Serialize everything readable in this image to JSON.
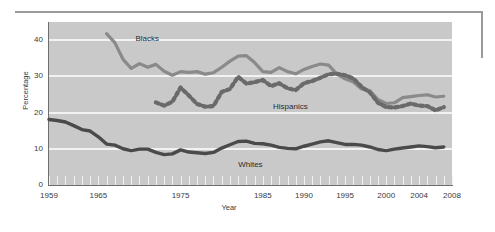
{
  "figure": {
    "y_axis_title": "Percentage",
    "x_axis_title": "Year"
  },
  "annotations": {
    "blacks": "Blacks",
    "hispanics": "Hispanics",
    "whites": "Whites"
  },
  "colors": {
    "plot_background": "#c9c9c9",
    "gridline": "#f2f2f2",
    "blacks_series": "#8a8a8a",
    "hispanics_series": "#6a6a6a",
    "whites_series": "#4a4a4a",
    "axis": "#6e6e6e",
    "text": "#3a3a3a",
    "rule": "#9a9a9a"
  },
  "chart_data": {
    "type": "line",
    "title": "",
    "xlabel": "Year",
    "ylabel": "Percentage",
    "xlim": [
      1959,
      2008
    ],
    "ylim": [
      0,
      45
    ],
    "yticks": [
      0,
      10,
      20,
      30,
      40
    ],
    "xticks": [
      1959,
      1965,
      1975,
      1985,
      1990,
      1995,
      2000,
      2004,
      2008
    ],
    "grid": "horizontal",
    "legend": "inline-annotations",
    "series": [
      {
        "name": "Blacks",
        "style": "solid",
        "color": "#8a8a8a",
        "x": [
          1966,
          1967,
          1968,
          1969,
          1970,
          1971,
          1972,
          1973,
          1974,
          1975,
          1976,
          1977,
          1978,
          1979,
          1980,
          1981,
          1982,
          1983,
          1984,
          1985,
          1986,
          1987,
          1988,
          1989,
          1990,
          1991,
          1992,
          1993,
          1994,
          1995,
          1996,
          1997,
          1998,
          1999,
          2000,
          2001,
          2002,
          2003,
          2004,
          2005,
          2006,
          2007
        ],
        "values": [
          41.8,
          39.3,
          34.7,
          32.2,
          33.5,
          32.5,
          33.3,
          31.4,
          30.3,
          31.3,
          31.1,
          31.3,
          30.6,
          31.0,
          32.5,
          34.2,
          35.6,
          35.7,
          33.8,
          31.3,
          31.1,
          32.4,
          31.3,
          30.7,
          31.9,
          32.7,
          33.4,
          33.1,
          30.6,
          29.3,
          28.4,
          26.5,
          26.1,
          23.6,
          22.5,
          22.7,
          24.1,
          24.4,
          24.7,
          24.9,
          24.3,
          24.5
        ]
      },
      {
        "name": "Hispanics",
        "style": "dashed",
        "color": "#6a6a6a",
        "x": [
          1972,
          1973,
          1974,
          1975,
          1976,
          1977,
          1978,
          1979,
          1980,
          1981,
          1982,
          1983,
          1984,
          1985,
          1986,
          1987,
          1988,
          1989,
          1990,
          1991,
          1992,
          1993,
          1994,
          1995,
          1996,
          1997,
          1998,
          1999,
          2000,
          2001,
          2002,
          2003,
          2004,
          2005,
          2006,
          2007
        ],
        "values": [
          22.8,
          21.9,
          23.0,
          26.9,
          24.7,
          22.4,
          21.6,
          21.8,
          25.7,
          26.5,
          29.9,
          28.0,
          28.4,
          29.0,
          27.3,
          28.1,
          26.7,
          26.2,
          28.1,
          28.7,
          29.6,
          30.6,
          30.7,
          30.3,
          29.4,
          27.1,
          25.6,
          22.7,
          21.5,
          21.4,
          21.8,
          22.5,
          21.9,
          21.8,
          20.6,
          21.5
        ]
      },
      {
        "name": "Whites",
        "style": "solid",
        "color": "#4a4a4a",
        "x": [
          1959,
          1960,
          1961,
          1962,
          1963,
          1964,
          1965,
          1966,
          1967,
          1968,
          1969,
          1970,
          1971,
          1972,
          1973,
          1974,
          1975,
          1976,
          1977,
          1978,
          1979,
          1980,
          1981,
          1982,
          1983,
          1984,
          1985,
          1986,
          1987,
          1988,
          1989,
          1990,
          1991,
          1992,
          1993,
          1994,
          1995,
          1996,
          1997,
          1998,
          1999,
          2000,
          2001,
          2002,
          2003,
          2004,
          2005,
          2006,
          2007
        ],
        "values": [
          18.1,
          17.8,
          17.4,
          16.4,
          15.3,
          14.9,
          13.3,
          11.3,
          11.0,
          10.0,
          9.5,
          9.9,
          9.9,
          9.0,
          8.4,
          8.6,
          9.7,
          9.1,
          8.9,
          8.7,
          9.0,
          10.2,
          11.1,
          12.0,
          12.1,
          11.5,
          11.4,
          11.0,
          10.4,
          10.1,
          10.0,
          10.7,
          11.3,
          11.9,
          12.2,
          11.7,
          11.2,
          11.2,
          11.0,
          10.5,
          9.8,
          9.5,
          9.9,
          10.2,
          10.5,
          10.8,
          10.6,
          10.3,
          10.5
        ]
      }
    ]
  }
}
